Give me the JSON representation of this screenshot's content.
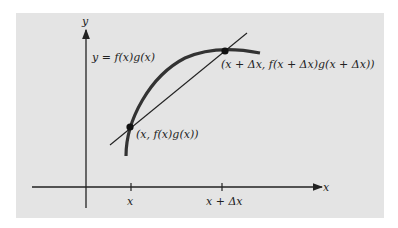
{
  "figure": {
    "background_color": "#e4e4e4",
    "axes": {
      "x_label": "x",
      "y_label": "y"
    },
    "curve_label": "y = f(x)g(x)",
    "points": [
      {
        "label": "(x, f(x)g(x))"
      },
      {
        "label": "(x + Δx, f(x + Δx)g(x + Δx))"
      }
    ],
    "ticks": [
      {
        "label": "x"
      },
      {
        "label": "x + Δx"
      }
    ]
  }
}
